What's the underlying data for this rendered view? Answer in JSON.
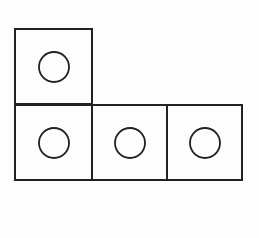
{
  "diagram": {
    "stroke_color": "#222222",
    "background_color": "#fdfdfd",
    "squares": [
      {
        "id": "top-left",
        "x": 15,
        "y": 29,
        "size": 77,
        "circle": {
          "cx": 54,
          "cy": 67,
          "r": 15
        }
      },
      {
        "id": "bottom-left",
        "x": 15,
        "y": 105,
        "size": 77,
        "circle": {
          "cx": 54,
          "cy": 143,
          "r": 15
        }
      },
      {
        "id": "bottom-middle",
        "x": 92,
        "y": 105,
        "size": 75,
        "circle": {
          "cx": 130,
          "cy": 143,
          "r": 15
        }
      },
      {
        "id": "bottom-right",
        "x": 167,
        "y": 105,
        "size": 75,
        "circle": {
          "cx": 205,
          "cy": 143,
          "r": 15
        }
      }
    ]
  }
}
